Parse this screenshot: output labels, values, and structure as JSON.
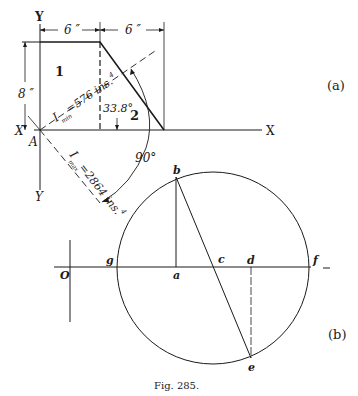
{
  "figure": {
    "caption": "Fig. 285.",
    "part_a_label": "(a)",
    "part_b_label": "(b)"
  },
  "part_a": {
    "axis_labels": {
      "y_top": "Y",
      "y_bottom": "Y",
      "x_left": "X",
      "x_right": "X",
      "origin": "A"
    },
    "dimensions": {
      "width_left": "6 ″",
      "width_right": "6 ″",
      "height": "8 ″"
    },
    "regions": [
      "1",
      "2"
    ],
    "angle_label": "33.8°",
    "right_angle_label": "90°",
    "i_min": {
      "symbol": "I",
      "subscript": "min",
      "value": "=576 ins.",
      "superscript": "4"
    },
    "i_max": {
      "symbol": "I",
      "subscript": "max",
      "value": "=2864 ins.",
      "superscript": "4"
    }
  },
  "part_b": {
    "origin_label": "O",
    "points": [
      "g",
      "a",
      "c",
      "d",
      "f",
      "b",
      "e"
    ],
    "colors": {
      "ink": "#1a1a1a",
      "background": "#ffffff"
    }
  }
}
